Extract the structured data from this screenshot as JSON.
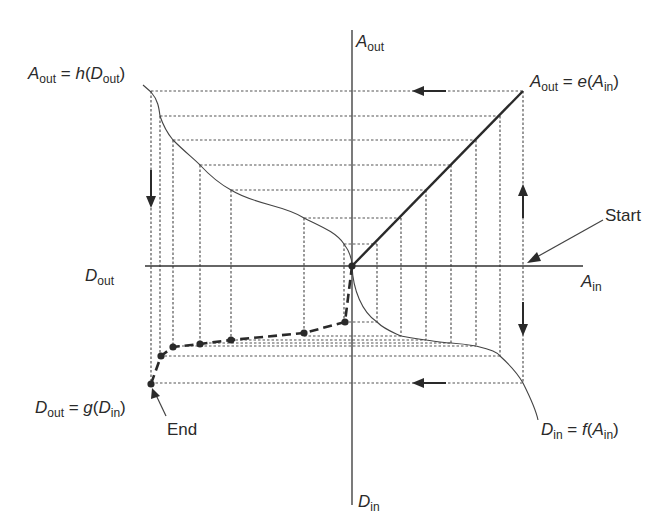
{
  "colors": {
    "ink": "#2a2a2a",
    "grid": "#555555",
    "background": "#ffffff"
  },
  "axes": {
    "origin": [
      352,
      266
    ],
    "a_out": {
      "var": "A",
      "sub": "out"
    },
    "a_in": {
      "var": "A",
      "sub": "in"
    },
    "d_out": {
      "var": "D",
      "sub": "out"
    },
    "d_in": {
      "var": "D",
      "sub": "in"
    }
  },
  "functions": {
    "h": {
      "lhs_var": "A",
      "lhs_sub": "out",
      "eq": " = ",
      "fn": "h",
      "arg_var": "D",
      "arg_sub": "out"
    },
    "e": {
      "lhs_var": "A",
      "lhs_sub": "out",
      "eq": " = ",
      "fn": "e",
      "arg_var": "A",
      "arg_sub": "in"
    },
    "f": {
      "lhs_var": "D",
      "lhs_sub": "in",
      "eq": " = ",
      "fn": "f",
      "arg_var": "A",
      "arg_sub": "in"
    },
    "g": {
      "lhs_var": "D",
      "lhs_sub": "out",
      "eq": " = ",
      "fn": "g",
      "arg_var": "D",
      "arg_sub": "in"
    }
  },
  "annotations": {
    "start": "Start",
    "end": "End"
  },
  "iteration": {
    "a_in_x": [
      377,
      401,
      426,
      451,
      476,
      500,
      523
    ],
    "a_out_y": [
      244,
      218,
      190,
      165,
      140,
      116,
      91
    ],
    "d_out_x": [
      344,
      304,
      231,
      200,
      173,
      160,
      151
    ],
    "d_in_y": [
      322,
      336,
      340,
      343,
      346,
      356,
      383
    ],
    "g_points": [
      [
        352,
        266
      ],
      [
        345,
        322
      ],
      [
        304,
        333
      ],
      [
        231,
        340
      ],
      [
        200,
        344
      ],
      [
        173,
        347
      ],
      [
        161,
        356
      ],
      [
        151,
        384
      ]
    ]
  }
}
